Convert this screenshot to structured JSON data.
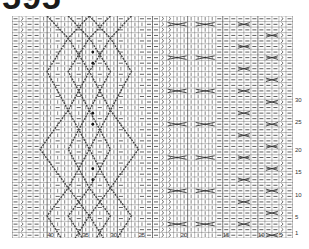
{
  "title": "595",
  "chart": {
    "columns": 40,
    "rows": 40,
    "grid_color": "#555555",
    "symbol_color": "#333333",
    "row_labels": [
      {
        "label": "30",
        "row": 15
      },
      {
        "label": "25",
        "row": 19
      },
      {
        "label": "20",
        "row": 24
      },
      {
        "label": "15",
        "row": 28
      },
      {
        "label": "10",
        "row": 32
      },
      {
        "label": "5",
        "row": 36
      },
      {
        "label": "1",
        "row": 39
      }
    ],
    "col_labels": [
      {
        "label": "40",
        "col": 5
      },
      {
        "label": "35",
        "col": 10
      },
      {
        "label": "30",
        "col": 14
      },
      {
        "label": "25",
        "col": 18
      },
      {
        "label": "20",
        "col": 24
      },
      {
        "label": "15",
        "col": 30
      },
      {
        "label": "10",
        "col": 35
      },
      {
        "label": "5",
        "col": 38
      }
    ],
    "symbols": {
      "purl": "—",
      "knit": "|",
      "twisted": "ℵ",
      "cable_cross": "X"
    }
  }
}
